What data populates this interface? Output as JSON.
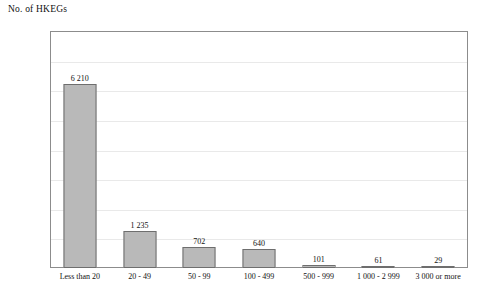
{
  "chart_data": {
    "type": "bar",
    "title": "No. of HKEGs",
    "xlabel": "",
    "ylabel": "No. of HKEGs",
    "ylim": [
      0,
      8000
    ],
    "grid": true,
    "legend": "none",
    "categories": [
      "Less than 20",
      "20 - 49",
      "50 - 99",
      "100 - 499",
      "500 - 999",
      "1 000 - 2 999",
      "3 000 or more"
    ],
    "values": [
      6210,
      1235,
      702,
      640,
      101,
      61,
      29
    ],
    "value_labels": [
      "6 210",
      "1 235",
      "702",
      "640",
      "101",
      "61",
      "29"
    ],
    "ytick_values": [
      0,
      1000,
      2000,
      3000,
      4000,
      5000,
      6000,
      7000,
      8000
    ],
    "ytick_labels": [
      "0",
      "1 000",
      "2 000",
      "3 000",
      "4 000",
      "5 000",
      "6 000",
      "7 000",
      "8 000"
    ],
    "colors": {
      "bar_fill": "#b9b9b9",
      "bar_border": "#6e6e6e",
      "frame": "#8c8c8c",
      "gridline": "#e9e9e9",
      "text": "#111111",
      "background": "#ffffff"
    }
  }
}
